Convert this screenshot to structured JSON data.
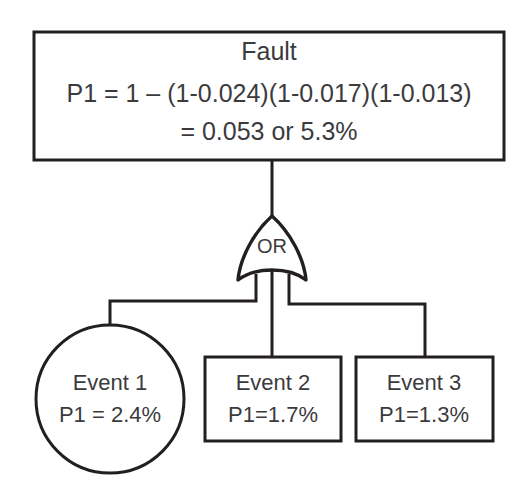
{
  "diagram": {
    "kind": "fault-tree",
    "colors": {
      "background": "#ffffff",
      "stroke": "#231f20",
      "text": "#3b3b3d",
      "fill": "#ffffff"
    },
    "top_event": {
      "shape": "rectangle",
      "title": "Fault",
      "formula_line1": "P1 = 1 – (1-0.024)(1-0.017)(1-0.013)",
      "formula_line2": "= 0.053 or 5.3%",
      "probability": 0.053,
      "probability_percent": "5.3%"
    },
    "gate": {
      "type": "OR",
      "label": "OR"
    },
    "basic_events": [
      {
        "shape": "circle",
        "name": "Event 1",
        "probability_label": "P1 = 2.4%",
        "probability": 0.024
      },
      {
        "shape": "rectangle",
        "name": "Event 2",
        "probability_label": "P1=1.7%",
        "probability": 0.017
      },
      {
        "shape": "rectangle",
        "name": "Event 3",
        "probability_label": "P1=1.3%",
        "probability": 0.013
      }
    ]
  }
}
